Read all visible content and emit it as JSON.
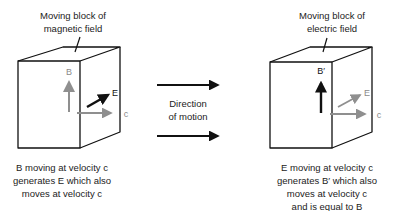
{
  "left_block": {
    "title_line1": "Moving block of",
    "title_line2": "magnetic field",
    "labels": {
      "vertical": "B",
      "diagonal": "E",
      "horizontal": "c"
    },
    "caption": [
      "B moving at velocity c",
      "generates E which also",
      "moves at velocity c"
    ]
  },
  "center": {
    "text_line1": "Direction",
    "text_line2": "of motion"
  },
  "right_block": {
    "title_line1": "Moving block of",
    "title_line2": "electric field",
    "labels": {
      "vertical": "B′",
      "diagonal": "E",
      "horizontal": "c"
    },
    "caption": [
      "E moving at velocity c",
      "generates B′ which also",
      "moves at velocity c",
      "and is equal to B"
    ]
  },
  "colors": {
    "outline": "#111111",
    "primary_arrow": "#111111",
    "secondary_arrow": "#8f8f8f"
  }
}
